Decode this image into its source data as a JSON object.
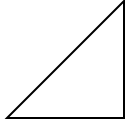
{
  "diagram": {
    "type": "geometry",
    "shape": "right-triangle",
    "vertices": [
      [
        7,
        118
      ],
      [
        124,
        118
      ],
      [
        124,
        1
      ]
    ],
    "stroke_color": "#000000",
    "fill_color": "#ffffff",
    "stroke_width": 2,
    "right_angle_vertex": [
      124,
      118
    ]
  }
}
